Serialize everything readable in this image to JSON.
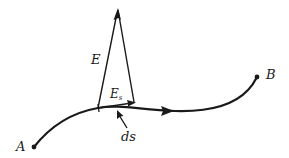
{
  "diagram": {
    "type": "vector-diagram",
    "colors": {
      "stroke": "#1a1a1a",
      "background": "#ffffff"
    },
    "labels": {
      "point_a": "A",
      "point_b": "B",
      "field_vector": "E",
      "component_main": "E",
      "component_sub": "s",
      "path_element": "ds"
    },
    "nodes": [
      {
        "id": "A",
        "label": "A",
        "x": 34,
        "y": 147
      },
      {
        "id": "B",
        "label": "B",
        "x": 257,
        "y": 77
      },
      {
        "id": "base",
        "label": "",
        "x": 98,
        "y": 108
      },
      {
        "id": "E_tip",
        "label": "E",
        "x": 118,
        "y": 9
      },
      {
        "id": "Es_tip",
        "label": "E_s",
        "x": 135,
        "y": 103
      }
    ],
    "edges": [
      {
        "from": "A",
        "to": "B",
        "kind": "curved-path",
        "arrow": "mid (toward B)"
      },
      {
        "from": "base",
        "to": "E_tip",
        "kind": "vector",
        "label": "E"
      },
      {
        "from": "base",
        "to": "Es_tip",
        "kind": "vector",
        "label": "E_s"
      },
      {
        "from": "E_tip",
        "to": "Es_tip",
        "kind": "projection-line"
      },
      {
        "from": "ds-label",
        "to": "path",
        "kind": "pointer-arrow",
        "label": "ds"
      }
    ]
  }
}
